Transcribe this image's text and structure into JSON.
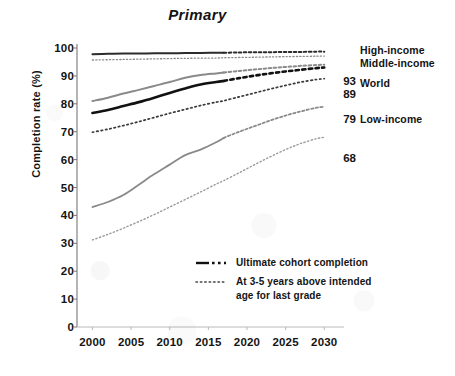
{
  "chart_data": {
    "type": "line",
    "title": "Primary",
    "xlabel": "",
    "ylabel": "Completion rate (%)",
    "xlim": [
      1998,
      2031
    ],
    "ylim": [
      0,
      100
    ],
    "grid": false,
    "legend_position": "inside-bottom-right",
    "x_ticks": [
      "2000",
      "2005",
      "2010",
      "2015",
      "2020",
      "2025",
      "2030"
    ],
    "y_ticks": [
      "0",
      "10",
      "20",
      "30",
      "40",
      "50",
      "60",
      "70",
      "80",
      "90",
      "100"
    ],
    "legend": [
      {
        "label": "Ultimate cohort completion",
        "style": "dash-dot"
      },
      {
        "label": "At 3-5 years above intended age for last grade",
        "style": "dotted"
      }
    ],
    "end_labels": [
      {
        "label": "High-income",
        "value": ""
      },
      {
        "label": "Middle-income",
        "value": ""
      },
      {
        "label": "World",
        "value": "93"
      },
      {
        "label": "",
        "value": "89"
      },
      {
        "label": "Low-income",
        "value": "79"
      },
      {
        "label": "",
        "value": "68"
      }
    ],
    "series": [
      {
        "name": "High-income ultimate cohort completion",
        "group": "High-income",
        "style": "solid-then-dashed",
        "color": "#2b2b2b",
        "width": 2.0,
        "observed_end_year": 2017,
        "x": [
          2000,
          2002,
          2004,
          2006,
          2008,
          2010,
          2012,
          2014,
          2016,
          2017,
          2019,
          2021,
          2023,
          2025,
          2027,
          2029,
          2030
        ],
        "y": [
          97.8,
          97.9,
          98.0,
          98.0,
          98.1,
          98.1,
          98.2,
          98.2,
          98.3,
          98.3,
          98.4,
          98.5,
          98.5,
          98.6,
          98.6,
          98.7,
          98.7
        ]
      },
      {
        "name": "High-income at 3-5 years above intended age",
        "group": "High-income",
        "style": "dotted",
        "color": "#8a8a8a",
        "width": 1.3,
        "observed_end_year": 2017,
        "x": [
          2000,
          2004,
          2008,
          2012,
          2016,
          2017,
          2021,
          2025,
          2030
        ],
        "y": [
          95.7,
          95.9,
          96.1,
          96.3,
          96.4,
          96.5,
          96.7,
          96.9,
          97.1
        ]
      },
      {
        "name": "Middle-income ultimate cohort completion",
        "group": "Middle-income",
        "style": "solid-then-dashed",
        "color": "#8a8a8a",
        "width": 2.0,
        "observed_end_year": 2017,
        "x": [
          2000,
          2002,
          2004,
          2006,
          2008,
          2010,
          2012,
          2014,
          2016,
          2017,
          2019,
          2021,
          2023,
          2025,
          2027,
          2029,
          2030
        ],
        "y": [
          81.0,
          82.2,
          83.7,
          85.0,
          86.4,
          87.8,
          89.3,
          90.3,
          90.9,
          91.2,
          91.8,
          92.3,
          92.8,
          93.2,
          93.6,
          93.9,
          94.0
        ]
      },
      {
        "name": "World ultimate cohort completion",
        "group": "World",
        "style": "solid-then-dashed",
        "color": "#111111",
        "width": 2.6,
        "observed_end_year": 2017,
        "x": [
          2000,
          2002,
          2004,
          2006,
          2008,
          2010,
          2012,
          2014,
          2016,
          2017,
          2019,
          2021,
          2023,
          2025,
          2027,
          2029,
          2030
        ],
        "y": [
          76.7,
          77.8,
          79.2,
          80.6,
          82.2,
          83.9,
          85.5,
          86.9,
          87.8,
          88.2,
          89.2,
          90.1,
          90.9,
          91.6,
          92.2,
          92.8,
          93.0
        ]
      },
      {
        "name": "World at 3-5 years above intended age",
        "group": "World",
        "style": "dotted",
        "color": "#3a3a3a",
        "width": 1.7,
        "observed_end_year": 2017,
        "x": [
          2000,
          2002,
          2004,
          2006,
          2008,
          2010,
          2012,
          2014,
          2016,
          2017,
          2019,
          2021,
          2023,
          2025,
          2027,
          2029,
          2030
        ],
        "y": [
          69.8,
          70.9,
          72.2,
          73.6,
          75.1,
          76.6,
          78.0,
          79.4,
          80.6,
          81.1,
          82.5,
          83.9,
          85.3,
          86.6,
          87.8,
          88.7,
          89.0
        ]
      },
      {
        "name": "Low-income ultimate cohort completion",
        "group": "Low-income",
        "style": "solid-then-dashed",
        "color": "#8a8a8a",
        "width": 1.8,
        "observed_end_year": 2017,
        "x": [
          2000,
          2002,
          2004,
          2006,
          2008,
          2010,
          2012,
          2014,
          2016,
          2017,
          2019,
          2021,
          2023,
          2025,
          2027,
          2029,
          2030
        ],
        "y": [
          43.0,
          44.8,
          47.3,
          51.0,
          54.8,
          58.2,
          61.6,
          63.6,
          66.2,
          67.8,
          70.0,
          72.0,
          74.0,
          75.8,
          77.3,
          78.6,
          79.0
        ]
      },
      {
        "name": "Low-income at 3-5 years above intended age",
        "group": "Low-income",
        "style": "dotted",
        "color": "#9a9a9a",
        "width": 1.4,
        "observed_end_year": 2017,
        "x": [
          2000,
          2002,
          2004,
          2006,
          2008,
          2010,
          2012,
          2014,
          2016,
          2017,
          2019,
          2021,
          2023,
          2025,
          2027,
          2029,
          2030
        ],
        "y": [
          31.2,
          33.2,
          35.4,
          37.8,
          40.3,
          43.0,
          45.7,
          48.4,
          51.2,
          52.5,
          55.3,
          58.2,
          61.0,
          63.6,
          65.8,
          67.5,
          68.0
        ]
      }
    ]
  },
  "plot": {
    "left": 77,
    "right": 332,
    "top": 48,
    "bottom": 327
  }
}
